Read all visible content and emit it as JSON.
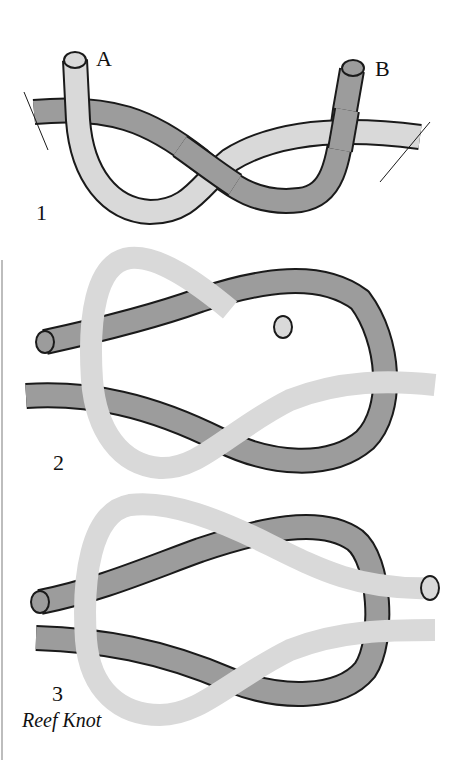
{
  "figure": {
    "top_clipped_text": "... knot (a) ... knot (b)",
    "end_labels": {
      "a": "A",
      "b": "B"
    },
    "steps": [
      {
        "number": "1"
      },
      {
        "number": "2"
      },
      {
        "number": "3"
      }
    ],
    "caption": "Reef Knot",
    "colors": {
      "rope_a": "#d9d9d9",
      "rope_b": "#9c9c9c",
      "outline": "#1a1a1a",
      "background": "#ffffff"
    }
  }
}
